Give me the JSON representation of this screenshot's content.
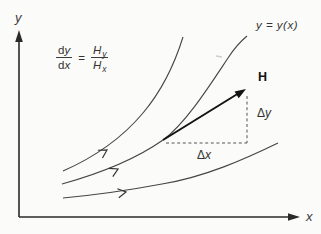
{
  "figure": {
    "colors": {
      "background": "#fbfbf9",
      "ink": "#3b3b3b",
      "bold_ink": "#141414"
    },
    "axes": {
      "x_label": "x",
      "y_label": "y"
    },
    "equation": {
      "numerator_d": "d",
      "numerator_var": "y",
      "denominator_d": "d",
      "denominator_var": "x",
      "equals": "=",
      "rhs_numerator_base": "H",
      "rhs_numerator_sub": "y",
      "rhs_denominator_base": "H",
      "rhs_denominator_sub": "x"
    },
    "curve_label": "y = y(x)",
    "vector_label": "H",
    "delta_y": {
      "delta": "Δ",
      "var": "y"
    },
    "delta_x": {
      "delta": "Δ",
      "var": "x"
    }
  }
}
